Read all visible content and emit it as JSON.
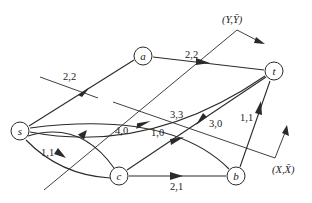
{
  "diagram": {
    "colors": {
      "stroke": "#2a2a2a",
      "background": "#ffffff"
    },
    "nodes": [
      {
        "id": "s",
        "label": "s",
        "x": 20,
        "y": 131
      },
      {
        "id": "a",
        "label": "a",
        "x": 143,
        "y": 56
      },
      {
        "id": "t",
        "label": "t",
        "x": 274,
        "y": 71
      },
      {
        "id": "c",
        "label": "c",
        "x": 119,
        "y": 176
      },
      {
        "id": "b",
        "label": "b",
        "x": 236,
        "y": 176
      }
    ],
    "edges": [
      {
        "from": "s",
        "to": "a",
        "label": "2,2"
      },
      {
        "from": "a",
        "to": "t",
        "label": "2,2"
      },
      {
        "from": "s",
        "to": "t",
        "label": "3,3"
      },
      {
        "from": "b",
        "to": "s",
        "label": "1,0"
      },
      {
        "from": "t",
        "to": "c",
        "label": "3,0"
      },
      {
        "from": "c",
        "to": "s",
        "label": "4,0"
      },
      {
        "from": "s",
        "to": "c",
        "label": "1,1"
      },
      {
        "from": "c",
        "to": "b",
        "label": "2,1"
      },
      {
        "from": "b",
        "to": "t",
        "label": "1,1"
      }
    ],
    "cuts": [
      {
        "name": "cut-s-a",
        "label": ""
      },
      {
        "name": "cut-Y",
        "label": "(Y,Ȳ)"
      },
      {
        "name": "cut-X",
        "label": "(X,X̄)"
      }
    ]
  },
  "labels": {
    "s": "s",
    "a": "a",
    "t": "t",
    "c": "c",
    "b": "b",
    "e_sa": "2,2",
    "e_at": "2,2",
    "e_st": "3,3",
    "e_bs": "1,0",
    "e_tc": "3,0",
    "e_cs": "4,0",
    "e_sc": "1,1",
    "e_cb": "2,1",
    "e_bt": "1,1",
    "cutY": "(Y,Ȳ)",
    "cutX": "(X,X̄)"
  }
}
